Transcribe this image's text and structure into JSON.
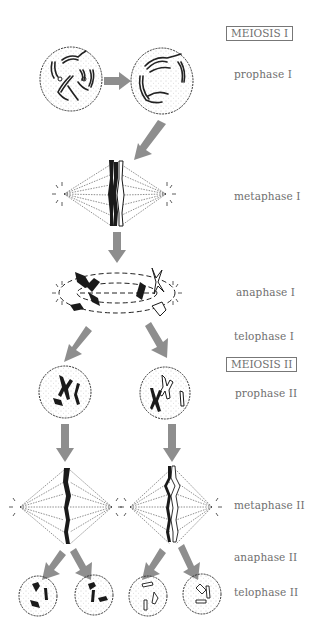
{
  "diagram": {
    "colors": {
      "arrow": "#8e8e8e",
      "label_text": "#6f6f6f",
      "chromosome_dark": "#1a1a1a",
      "cell_outline": "#333333"
    },
    "sections": [
      {
        "id": "meiosis1",
        "label": "MEIOSIS I"
      },
      {
        "id": "meiosis2",
        "label": "MEIOSIS II"
      }
    ],
    "stages": [
      {
        "id": "prophase1",
        "label": "prophase I"
      },
      {
        "id": "metaphase1",
        "label": "metaphase I"
      },
      {
        "id": "anaphase1",
        "label": "anaphase I"
      },
      {
        "id": "telophase1",
        "label": "telophase I"
      },
      {
        "id": "prophase2",
        "label": "prophase II"
      },
      {
        "id": "metaphase2",
        "label": "metaphase II"
      },
      {
        "id": "anaphase2",
        "label": "anaphase II"
      },
      {
        "id": "telophase2",
        "label": "telophase II"
      }
    ]
  }
}
